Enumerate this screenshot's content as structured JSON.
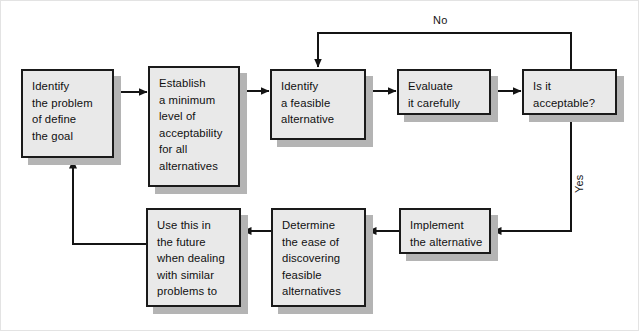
{
  "diagram": {
    "colors": {
      "node_fill": "#e9e9e9",
      "node_border": "#1a1a1a",
      "shadow": "#b4b4b4",
      "line": "#141414",
      "text": "#101010",
      "frame": "#e3e3e3"
    },
    "nodes": [
      {
        "id": "identify-problem",
        "lines": [
          "Identify",
          "the problem",
          "of define",
          "the goal"
        ],
        "x": 20,
        "y": 68,
        "w": 93,
        "h": 89
      },
      {
        "id": "establish-minimum",
        "lines": [
          "Establish",
          "a minimum",
          "level of",
          "acceptability",
          "for all",
          "alternatives"
        ],
        "x": 147,
        "y": 65,
        "w": 92,
        "h": 121
      },
      {
        "id": "identify-feasible",
        "lines": [
          "Identify",
          "a feasible",
          "alternative"
        ],
        "x": 269,
        "y": 68,
        "w": 96,
        "h": 71
      },
      {
        "id": "evaluate-carefully",
        "lines": [
          "Evaluate",
          "it carefully"
        ],
        "x": 396,
        "y": 68,
        "w": 94,
        "h": 46
      },
      {
        "id": "is-it-acceptable",
        "lines": [
          "Is it",
          "acceptable?"
        ],
        "x": 521,
        "y": 68,
        "w": 95,
        "h": 46
      },
      {
        "id": "implement-alternative",
        "lines": [
          "Implement",
          "the alternative"
        ],
        "x": 398,
        "y": 207,
        "w": 92,
        "h": 46
      },
      {
        "id": "determine-ease",
        "lines": [
          "Determine",
          "the ease of",
          "discovering",
          "feasible",
          "alternatives"
        ],
        "x": 270,
        "y": 207,
        "w": 95,
        "h": 99
      },
      {
        "id": "use-this-future",
        "lines": [
          "Use this in",
          "the future",
          "when dealing",
          "with similar",
          "problems to"
        ],
        "x": 145,
        "y": 207,
        "w": 95,
        "h": 99
      }
    ],
    "edge_labels": [
      {
        "id": "no-label",
        "text": "No",
        "x": 432,
        "y": 13
      },
      {
        "id": "yes-label",
        "text": "Yes",
        "x": 572,
        "y": 192
      }
    ],
    "connectors": [
      {
        "id": "problem-to-establish",
        "from": "identify-problem",
        "to": "establish-minimum"
      },
      {
        "id": "establish-to-feasible",
        "from": "establish-minimum",
        "to": "identify-feasible"
      },
      {
        "id": "feasible-to-evaluate",
        "from": "identify-feasible",
        "to": "evaluate-carefully"
      },
      {
        "id": "evaluate-to-acceptable",
        "from": "evaluate-carefully",
        "to": "is-it-acceptable"
      },
      {
        "id": "no-loop-back",
        "from": "is-it-acceptable",
        "to": "identify-feasible",
        "label": "No"
      },
      {
        "id": "yes-to-implement",
        "from": "is-it-acceptable",
        "to": "implement-alternative",
        "label": "Yes"
      },
      {
        "id": "implement-to-determine",
        "from": "implement-alternative",
        "to": "determine-ease"
      },
      {
        "id": "determine-to-usethis",
        "from": "determine-ease",
        "to": "use-this-future"
      },
      {
        "id": "usethis-to-problem",
        "from": "use-this-future",
        "to": "identify-problem"
      }
    ]
  }
}
